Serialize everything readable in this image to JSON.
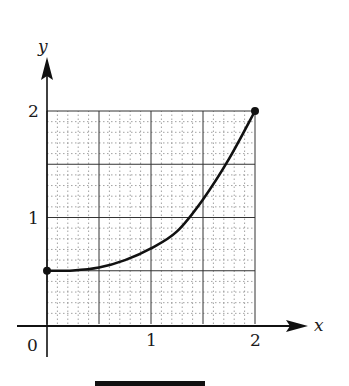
{
  "chart_data": {
    "type": "line",
    "title": "",
    "xlabel": "x",
    "ylabel": "y",
    "xlim": [
      0,
      2
    ],
    "ylim": [
      0,
      2
    ],
    "x_ticks": [
      "0",
      "1",
      "2"
    ],
    "y_ticks": [
      "1",
      "2"
    ],
    "grid": {
      "major_step": 0.5,
      "minor_step": 0.1,
      "minor_style": "dotted"
    },
    "series": [
      {
        "name": "curve",
        "x": [
          0,
          0.25,
          0.5,
          0.75,
          1.0,
          1.25,
          1.5,
          1.75,
          2.0
        ],
        "y": [
          0.5,
          0.503,
          0.53,
          0.6,
          0.71,
          0.87,
          1.17,
          1.55,
          2.0
        ],
        "endpoints": [
          [
            0,
            0.5
          ],
          [
            2,
            2
          ]
        ]
      }
    ]
  },
  "labels": {
    "x_axis": "x",
    "y_axis": "y",
    "origin": "0",
    "x_tick_1": "1",
    "x_tick_2": "2",
    "y_tick_1": "1",
    "y_tick_2": "2"
  },
  "colors": {
    "ink": "#111111",
    "grid_minor": "#8a8a8a",
    "grid_major": "#333333"
  }
}
